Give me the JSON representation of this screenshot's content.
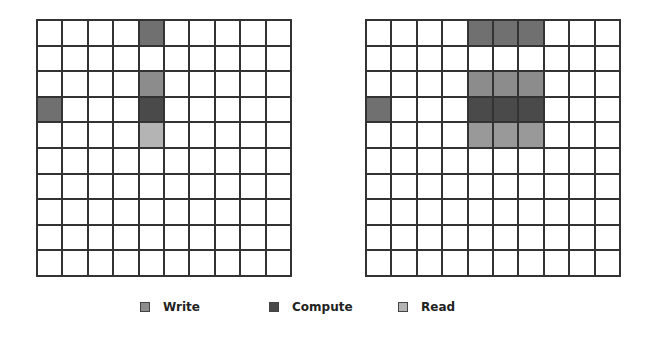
{
  "colors": {
    "write": "#8c8c8c",
    "write_top": "#707070",
    "compute": "#4a4a4a",
    "read": "#b4b4b4",
    "read_right": "#999999",
    "empty": "#ffffff"
  },
  "grids": [
    {
      "name": "left",
      "rows": 10,
      "cols": 10,
      "filled": [
        {
          "row": 0,
          "col": 4,
          "type": "write_top"
        },
        {
          "row": 2,
          "col": 4,
          "type": "write"
        },
        {
          "row": 3,
          "col": 0,
          "type": "write_top"
        },
        {
          "row": 3,
          "col": 4,
          "type": "compute"
        },
        {
          "row": 4,
          "col": 4,
          "type": "read"
        }
      ]
    },
    {
      "name": "right",
      "rows": 10,
      "cols": 10,
      "filled": [
        {
          "row": 0,
          "col": 4,
          "type": "write_top"
        },
        {
          "row": 0,
          "col": 5,
          "type": "write_top"
        },
        {
          "row": 0,
          "col": 6,
          "type": "write_top"
        },
        {
          "row": 2,
          "col": 4,
          "type": "write"
        },
        {
          "row": 2,
          "col": 5,
          "type": "write"
        },
        {
          "row": 2,
          "col": 6,
          "type": "write"
        },
        {
          "row": 3,
          "col": 0,
          "type": "write_top"
        },
        {
          "row": 3,
          "col": 4,
          "type": "compute"
        },
        {
          "row": 3,
          "col": 5,
          "type": "compute"
        },
        {
          "row": 3,
          "col": 6,
          "type": "compute"
        },
        {
          "row": 4,
          "col": 4,
          "type": "read_right"
        },
        {
          "row": 4,
          "col": 5,
          "type": "read_right"
        },
        {
          "row": 4,
          "col": 6,
          "type": "read_right"
        }
      ]
    }
  ],
  "legend": {
    "items": [
      {
        "label": "Write",
        "color": "#8c8c8c",
        "x": 140
      },
      {
        "label": "Compute",
        "color": "#4a4a4a",
        "x": 269
      },
      {
        "label": "Read",
        "color": "#b4b4b4",
        "x": 398
      }
    ]
  }
}
